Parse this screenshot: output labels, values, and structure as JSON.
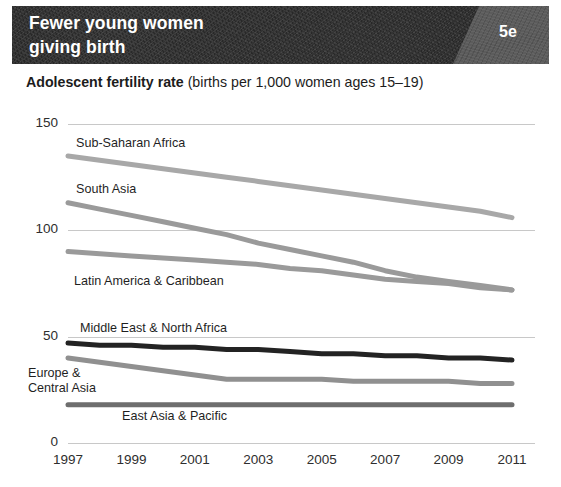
{
  "banner": {
    "title": "Fewer young women\ngiving birth",
    "tag": "5e",
    "bg_color": "#2b2b2b",
    "tag_color": "#5c5c5c"
  },
  "subtitle": {
    "strong": "Adolescent fertility rate",
    "light": " (births per 1,000 women ages 15–19)"
  },
  "chart_data": {
    "type": "line",
    "title": "Fewer young women giving birth",
    "subtitle": "Adolescent fertility rate (births per 1,000 women ages 15-19)",
    "xlabel": "",
    "ylabel": "",
    "ylim": [
      0,
      150
    ],
    "yticks": [
      150,
      100,
      50,
      0
    ],
    "grid": true,
    "legend": "inline-labels",
    "x": [
      1997,
      1998,
      1999,
      2000,
      2001,
      2002,
      2003,
      2004,
      2005,
      2006,
      2007,
      2008,
      2009,
      2010,
      2011
    ],
    "xticks": [
      "1997",
      "1999",
      "2001",
      "2003",
      "2005",
      "2007",
      "2009",
      "2011"
    ],
    "series": [
      {
        "name": "Sub-Saharan Africa",
        "color": "#a8a8a8",
        "width": 5,
        "label_x": 76,
        "label_y": 136,
        "values": [
          135,
          133,
          131,
          129,
          127,
          125,
          123,
          121,
          119,
          117,
          115,
          113,
          111,
          109,
          106
        ]
      },
      {
        "name": "South Asia",
        "color": "#9a9a9a",
        "width": 5,
        "label_x": 76,
        "label_y": 182,
        "values": [
          113,
          110,
          107,
          104,
          101,
          98,
          94,
          91,
          88,
          85,
          81,
          78,
          76,
          74,
          72
        ]
      },
      {
        "name": "Latin America & Caribbean",
        "color": "#9a9a9a",
        "width": 5,
        "label_x": 74,
        "label_y": 274,
        "values": [
          90,
          89,
          88,
          87,
          86,
          85,
          84,
          82,
          81,
          79,
          77,
          76,
          75,
          73,
          72
        ]
      },
      {
        "name": "Middle East & North Africa",
        "color": "#232323",
        "width": 5,
        "label_x": 80,
        "label_y": 321,
        "values": [
          47,
          46,
          46,
          45,
          45,
          44,
          44,
          43,
          42,
          42,
          41,
          41,
          40,
          40,
          39
        ]
      },
      {
        "name": "Europe &\nCentral Asia",
        "color": "#909090",
        "width": 5,
        "label_x": 28,
        "label_y": 366,
        "values": [
          40,
          38,
          36,
          34,
          32,
          30,
          30,
          30,
          30,
          29,
          29,
          29,
          29,
          28,
          28
        ]
      },
      {
        "name": "East Asia & Pacific",
        "color": "#6e6e6e",
        "width": 5,
        "label_x": 122,
        "label_y": 409,
        "values": [
          18,
          18,
          18,
          18,
          18,
          18,
          18,
          18,
          18,
          18,
          18,
          18,
          18,
          18,
          18
        ]
      }
    ]
  },
  "axis_geometry": {
    "x_left_px": 68,
    "x_right_px": 512,
    "y_zero_px": 443,
    "y_top_px": 124,
    "grid_right_px": 535
  }
}
